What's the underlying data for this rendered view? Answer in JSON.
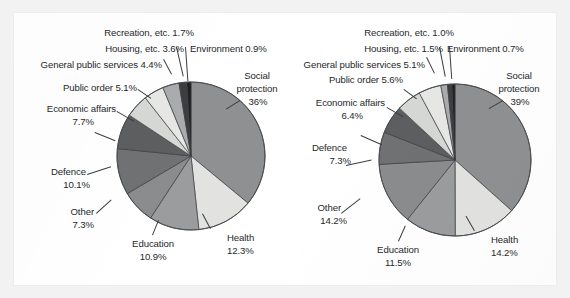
{
  "figure": {
    "background_color": "#f2f2f2",
    "panel_color": "#ffffff",
    "text_color": "#26282a"
  },
  "chart_data": [
    {
      "type": "pie",
      "title": "",
      "chart_id": "left",
      "start_angle_deg": 0,
      "direction": "clockwise",
      "legend": "none",
      "labels_outside": true,
      "categories": [
        "Social protection",
        "Health",
        "Education",
        "Other",
        "Defence",
        "Economic affairs",
        "Public order",
        "General public services",
        "Housing, etc.",
        "Recreation, etc.",
        "Environment"
      ],
      "values": [
        36,
        12.3,
        10.9,
        7.3,
        10.1,
        7.7,
        5.1,
        4.4,
        3.6,
        1.7,
        0.9
      ],
      "value_labels": [
        "36%",
        "12.3%",
        "10.9%",
        "7.3%",
        "10.1%",
        "7.7%",
        "5.1%",
        "4.4%",
        "3.6%",
        "1.7%",
        "0.9%"
      ],
      "slice_colors": [
        "#8e9092",
        "#e2e3e1",
        "#9a9c9e",
        "#8a8c8e",
        "#6f7173",
        "#5c5e60",
        "#d6d8d6",
        "#e7e8e6",
        "#a9abad",
        "#3b3d3f",
        "#1d1f21"
      ]
    },
    {
      "type": "pie",
      "title": "",
      "chart_id": "right",
      "start_angle_deg": 0,
      "direction": "clockwise",
      "legend": "none",
      "labels_outside": true,
      "categories": [
        "Social protection",
        "Health",
        "Education",
        "Other",
        "Defence",
        "Economic affairs",
        "Public order",
        "General public services",
        "Housing, etc.",
        "Recreation, etc.",
        "Environment"
      ],
      "values": [
        39,
        14.2,
        11.5,
        14.2,
        7.3,
        6.4,
        5.6,
        5.1,
        1.5,
        1.0,
        0.7
      ],
      "value_labels": [
        "39%",
        "14.2%",
        "11.5%",
        "14.2%",
        "7.3%",
        "6.4%",
        "5.6%",
        "5.1%",
        "1.5%",
        "1.0%",
        "0.7%"
      ],
      "slice_colors": [
        "#8e9092",
        "#e2e3e1",
        "#9a9c9e",
        "#8a8c8e",
        "#6f7173",
        "#5c5e60",
        "#d6d8d6",
        "#e7e8e6",
        "#a9abad",
        "#3b3d3f",
        "#1d1f21"
      ]
    }
  ],
  "left_chart": {
    "labels": {
      "recreation": "Recreation, etc. 1.7%",
      "housing": "Housing, etc. 3.6%",
      "environment": "Environment 0.9%",
      "general": "General public services 4.4%",
      "public_order": "Public order 5.1%",
      "economic_l1": "Economic affairs",
      "economic_l2": "7.7%",
      "defence_l1": "Defence",
      "defence_l2": "10.1%",
      "other_l1": "Other",
      "other_l2": "7.3%",
      "education_l1": "Education",
      "education_l2": "10.9%",
      "health_l1": "Health",
      "health_l2": "12.3%",
      "social_l1": "Social",
      "social_l2": "protection",
      "social_l3": "36%"
    }
  },
  "right_chart": {
    "labels": {
      "recreation": "Recreation, etc. 1.0%",
      "housing": "Housing, etc. 1.5%",
      "environment": "Environment 0.7%",
      "general": "General public services 5.1%",
      "public_order": "Public order 5.6%",
      "economic_l1": "Economic affairs",
      "economic_l2": "6.4%",
      "defence_l1": "Defence",
      "defence_l2": "7.3%",
      "other_l1": "Other",
      "other_l2": "14.2%",
      "education_l1": "Education",
      "education_l2": "11.5%",
      "health_l1": "Health",
      "health_l2": "14.2%",
      "social_l1": "Social",
      "social_l2": "protection",
      "social_l3": "39%"
    }
  }
}
